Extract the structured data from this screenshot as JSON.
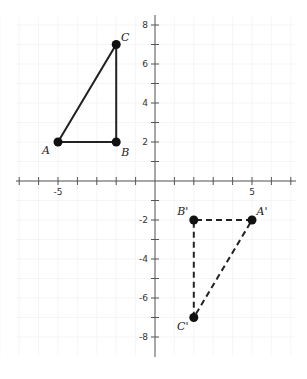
{
  "diagram": {
    "type": "coordinate-plane-reflection",
    "x_tick_labels": [
      {
        "value": -5,
        "text": "-5"
      },
      {
        "value": 5,
        "text": "5"
      }
    ],
    "y_tick_labels": [
      {
        "value": 8,
        "text": "8"
      },
      {
        "value": 6,
        "text": "6"
      },
      {
        "value": 4,
        "text": "4"
      },
      {
        "value": 2,
        "text": "2"
      },
      {
        "value": -2,
        "text": "-2"
      },
      {
        "value": -4,
        "text": "-4"
      },
      {
        "value": -6,
        "text": "-6"
      },
      {
        "value": -8,
        "text": "-8"
      }
    ],
    "original_triangle": {
      "style": "solid",
      "points": [
        {
          "label": "A",
          "x": -5,
          "y": 2
        },
        {
          "label": "B",
          "x": -2,
          "y": 2
        },
        {
          "label": "C",
          "x": -2,
          "y": 7
        }
      ]
    },
    "image_triangle": {
      "style": "dashed",
      "points": [
        {
          "label": "A'",
          "x": 5,
          "y": -2
        },
        {
          "label": "B'",
          "x": 2,
          "y": -2
        },
        {
          "label": "C'",
          "x": 2,
          "y": -7
        }
      ]
    },
    "colors": {
      "line": "#222222",
      "axis": "#555555",
      "grid": "#eeeeee"
    }
  }
}
